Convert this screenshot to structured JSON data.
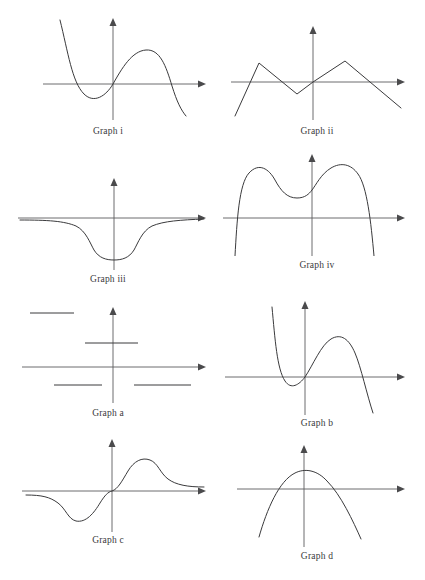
{
  "page": {
    "background_color": "#ffffff",
    "ink_color": "#3a3a3c",
    "axis_color": "#5c5c5e",
    "width": 425,
    "height": 580
  },
  "figures": [
    {
      "id": "graph-i",
      "label": "Graph i",
      "shape": "cubic-negative-leading",
      "description": "Cubic curve falling from upper left, local minimum left of origin below axis, rising through origin to a local maximum right of origin, then falling steeply to lower right",
      "x": 8,
      "y": 8,
      "w": 200,
      "h": 128,
      "origin": [
        105,
        76
      ],
      "x_axis": [
        35,
        195
      ],
      "y_axis": [
        14,
        125
      ],
      "label_y": 118
    },
    {
      "id": "graph-ii",
      "label": "Graph ii",
      "shape": "piecewise-linear-zigzag",
      "description": "Zigzag of straight line segments: rising from lower left to a peak, down to a trough just left of origin, up through origin to a second peak, then down to lower right crossing the axis",
      "x": 217,
      "y": 8,
      "w": 200,
      "h": 128,
      "origin": [
        96,
        74
      ],
      "x_axis": [
        14,
        185
      ],
      "y_axis": [
        22,
        118
      ],
      "label_y": 118,
      "vertices": [
        [
          18,
          108
        ],
        [
          42,
          55
        ],
        [
          80,
          84
        ],
        [
          96,
          74
        ],
        [
          128,
          53
        ],
        [
          185,
          97
        ]
      ]
    },
    {
      "id": "graph-iii",
      "label": "Graph iii",
      "shape": "inverted-bell-well",
      "description": "Flat along the x-axis at both far ends with a single smooth well dipping below the axis centered on the y-axis",
      "x": 8,
      "y": 150,
      "w": 200,
      "h": 135,
      "origin": [
        106,
        68
      ],
      "x_axis": [
        10,
        196
      ],
      "y_axis": [
        26,
        130
      ],
      "label_y": 124
    },
    {
      "id": "graph-iv",
      "label": "Graph iv",
      "shape": "quartic-negative-two-maxima",
      "description": "Downward quartic with two maxima above the axis separated by a local minimum above the axis, both arms plunging steeply below the x-axis at the sides",
      "x": 217,
      "y": 150,
      "w": 200,
      "h": 135,
      "origin": [
        95,
        68
      ],
      "x_axis": [
        8,
        190
      ],
      "y_axis": [
        10,
        112
      ],
      "label_y": 110
    },
    {
      "id": "graph-a",
      "label": "Graph a",
      "shape": "step-function",
      "description": "Four disjoint horizontal segments at decreasing heights: high level far left, a level above the axis spanning the y-axis, and two levels below the axis",
      "x": 8,
      "y": 295,
      "w": 200,
      "h": 128,
      "origin": [
        105,
        72
      ],
      "x_axis": [
        14,
        196
      ],
      "y_axis": [
        12,
        125
      ],
      "label_y": 113,
      "steps": [
        {
          "x1": 22,
          "x2": 66,
          "y": 18
        },
        {
          "x1": 77,
          "x2": 130,
          "y": 48
        },
        {
          "x1": 46,
          "x2": 94,
          "y": 90
        },
        {
          "x1": 126,
          "x2": 183,
          "y": 90
        }
      ]
    },
    {
      "id": "graph-b",
      "label": "Graph b",
      "shape": "cubic-negative-steep",
      "description": "Steep cubic descending from top, a local minimum below the axis left of the y-axis, crossing the axis at the origin, up to a local maximum, then plunging to lower right",
      "x": 217,
      "y": 295,
      "w": 200,
      "h": 135,
      "origin": [
        88,
        82
      ],
      "x_axis": [
        8,
        190
      ],
      "y_axis": [
        10,
        130
      ],
      "label_y": 123
    },
    {
      "id": "graph-c",
      "label": "Graph c",
      "shape": "odd-sigmoid-bump",
      "description": "Odd-symmetric curve flat at the left along the axis, dipping to a minimum below the axis, rising through the origin to a maximum above the axis, then flattening out to the right",
      "x": 8,
      "y": 437,
      "w": 200,
      "h": 140,
      "origin": [
        104,
        54
      ],
      "x_axis": [
        14,
        196
      ],
      "y_axis": [
        4,
        100
      ],
      "label_y": 98
    },
    {
      "id": "graph-d",
      "label": "Graph d",
      "shape": "parabola-downward",
      "description": "Downward-opening parabola with vertex above the x-axis just right of the y-axis, crossing the axis on both sides",
      "x": 217,
      "y": 437,
      "w": 200,
      "h": 140,
      "origin": [
        87,
        52
      ],
      "x_axis": [
        20,
        190
      ],
      "y_axis": [
        8,
        118
      ],
      "label_y": 114
    }
  ]
}
